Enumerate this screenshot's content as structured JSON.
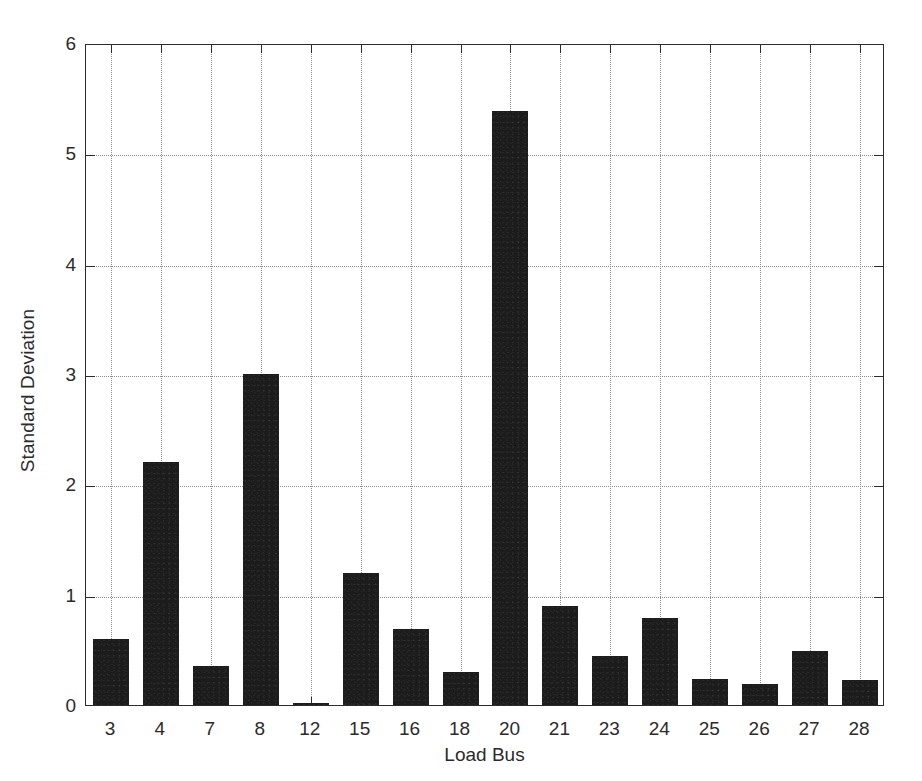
{
  "chart_data": {
    "type": "bar",
    "title": "",
    "xlabel": "Load Bus",
    "ylabel": "Standard Deviation",
    "categories": [
      "3",
      "4",
      "7",
      "8",
      "12",
      "15",
      "16",
      "18",
      "20",
      "21",
      "23",
      "24",
      "25",
      "26",
      "27",
      "28"
    ],
    "values": [
      0.6,
      2.2,
      0.35,
      3.0,
      0.02,
      1.2,
      0.69,
      0.3,
      5.38,
      0.9,
      0.44,
      0.79,
      0.24,
      0.19,
      0.49,
      0.23
    ],
    "series": [
      {
        "name": "Standard Deviation",
        "values": [
          0.6,
          2.2,
          0.35,
          3.0,
          0.02,
          1.2,
          0.69,
          0.3,
          5.38,
          0.9,
          0.44,
          0.79,
          0.24,
          0.19,
          0.49,
          0.23
        ]
      }
    ],
    "ylim": [
      0,
      6
    ],
    "yticks": [
      0,
      1,
      2,
      3,
      4,
      5,
      6
    ],
    "ytick_labels": [
      "0",
      "1",
      "2",
      "3",
      "4",
      "5",
      "6"
    ],
    "xtick_labels": [
      "3",
      "4",
      "7",
      "8",
      "12",
      "15",
      "16",
      "18",
      "20",
      "21",
      "23",
      "24",
      "25",
      "26",
      "27",
      "28"
    ],
    "grid": true,
    "grid_style": "dotted",
    "legend": null,
    "legend_position": "none",
    "bar_color": "#1c1c1c",
    "grid_color": "#8c8c8c",
    "axis_color": "#2b2b2b",
    "background_color": "#ffffff",
    "bar_width_ratio": 0.72
  }
}
